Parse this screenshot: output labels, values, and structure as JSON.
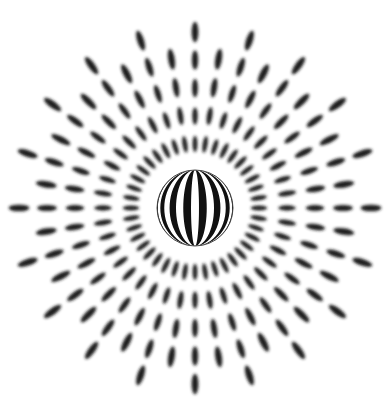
{
  "image": {
    "description": "Optical illusion: striped sphere surrounded by radial blurred dashes",
    "width": 391,
    "height": 410,
    "background": "#ffffff",
    "ink": "#1a1a1a"
  },
  "sphere": {
    "cx": 195,
    "cy": 208,
    "r": 38,
    "stripe_count": 15,
    "stripe_colors": [
      "#111111",
      "#ffffff"
    ]
  },
  "rays": {
    "count": 40,
    "inner_radius": 50,
    "outer_radius_long": 190,
    "outer_radius_short": 165,
    "dashes_per_ray": 4,
    "dash_length": 24,
    "dash_width": 6,
    "blur": 1.6
  }
}
